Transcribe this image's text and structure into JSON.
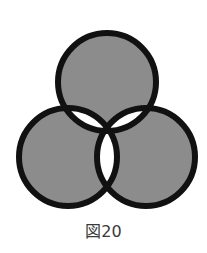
{
  "figure": {
    "type": "three-circle-venn-xor",
    "fill_color": "#8c8c8c",
    "stroke_color": "#111111",
    "background": "#ffffff",
    "circles": [
      {
        "name": "top",
        "cx": 107,
        "cy": 82,
        "r": 49
      },
      {
        "name": "left",
        "cx": 68,
        "cy": 157,
        "r": 49
      },
      {
        "name": "right",
        "cx": 146,
        "cy": 157,
        "r": 49
      }
    ],
    "regions": {
      "single": "filled",
      "pairwise_overlap": "white",
      "triple_overlap": "filled"
    }
  },
  "caption": "図20"
}
